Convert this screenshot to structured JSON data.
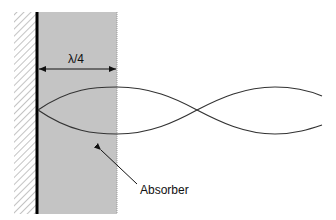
{
  "diagram": {
    "labels": {
      "distance": "λ/4",
      "material": "Absorber"
    },
    "colors": {
      "absorber_fill": "#c4c4c4",
      "wall_line": "#000000",
      "curve": "#333333"
    }
  }
}
